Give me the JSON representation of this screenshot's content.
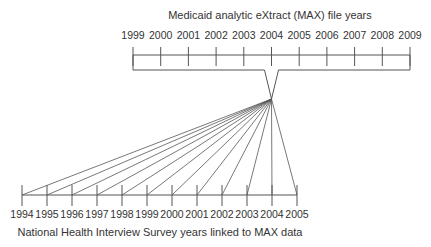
{
  "top_timeline": {
    "title": "Medicaid analytic eXtract (MAX) file years",
    "years": [
      "1999",
      "2000",
      "2001",
      "2002",
      "2003",
      "2004",
      "2005",
      "2006",
      "2007",
      "2008",
      "2009"
    ]
  },
  "bottom_timeline": {
    "title": "National Health Interview Survey years linked to MAX data",
    "years": [
      "1994",
      "1995",
      "1996",
      "1997",
      "1998",
      "1999",
      "2000",
      "2001",
      "2002",
      "2003",
      "2004",
      "2005"
    ]
  },
  "link": {
    "bracketed_max_year": "2004"
  }
}
